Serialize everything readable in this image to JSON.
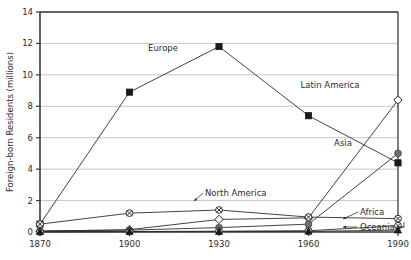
{
  "chart_data": {
    "type": "line",
    "title": "",
    "xlabel": "",
    "ylabel": "Foreign-born Residents (millions)",
    "x": [
      1870,
      1900,
      1930,
      1960,
      1990
    ],
    "xtick_labels": [
      "1870",
      "1900",
      "1930",
      "1960",
      "1990"
    ],
    "ytick_labels": [
      "0",
      "2",
      "4",
      "6",
      "8",
      "10",
      "12",
      "14"
    ],
    "yticks": [
      0,
      2,
      4,
      6,
      8,
      10,
      12,
      14
    ],
    "ylim": [
      0,
      14
    ],
    "xlim": [
      1870,
      1990
    ],
    "grid": "horizontal",
    "legend": "inline-labels",
    "series": [
      {
        "name": "Europe",
        "marker": "filled-square",
        "color": "#1a1a1a",
        "values": [
          0.5,
          8.9,
          11.8,
          7.4,
          4.4
        ]
      },
      {
        "name": "Latin America",
        "marker": "hollow-diamond",
        "color": "#1a1a1a",
        "values": [
          0.05,
          0.15,
          0.8,
          0.9,
          8.4
        ]
      },
      {
        "name": "Asia",
        "marker": "filled-circle-gray",
        "color": "#6e6e6e",
        "values": [
          0.07,
          0.12,
          0.28,
          0.5,
          5.0
        ]
      },
      {
        "name": "North America",
        "marker": "circle-x",
        "color": "#1a1a1a",
        "values": [
          0.5,
          1.2,
          1.4,
          0.95,
          0.85
        ]
      },
      {
        "name": "Africa",
        "marker": "circle-x",
        "color": "#1a1a1a",
        "values": [
          0.02,
          0.03,
          0.05,
          0.08,
          0.4
        ]
      },
      {
        "name": "Oceania",
        "marker": "filled-triangle",
        "color": "#1a1a1a",
        "values": [
          0.01,
          0.02,
          0.03,
          0.04,
          0.12
        ]
      }
    ],
    "annotations": [
      {
        "text": "Europe",
        "for": "Europe"
      },
      {
        "text": "Latin America",
        "for": "Latin America"
      },
      {
        "text": "Asia",
        "for": "Asia"
      },
      {
        "text": "North America",
        "for": "North America"
      },
      {
        "text": "Africa",
        "for": "Africa"
      },
      {
        "text": "Oceania",
        "for": "Oceania"
      }
    ]
  }
}
